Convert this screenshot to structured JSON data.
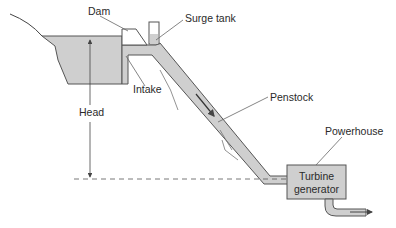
{
  "diagram": {
    "labels": {
      "dam": "Dam",
      "surge_tank": "Surge tank",
      "intake": "Intake",
      "head": "Head",
      "penstock": "Penstock",
      "powerhouse": "Powerhouse",
      "turbine_line1": "Turbine",
      "turbine_line2": "generator"
    },
    "colors": {
      "water": "#cfcfcf",
      "outline": "#555555",
      "text": "#2a2a2a",
      "background": "#ffffff"
    }
  }
}
